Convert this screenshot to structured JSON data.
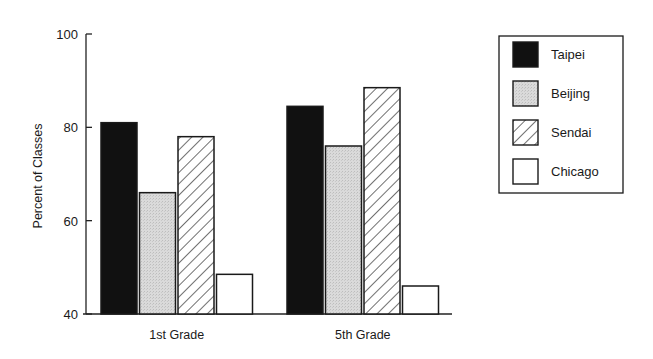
{
  "chart_data": {
    "type": "bar",
    "title": "",
    "xlabel": "",
    "ylabel": "Percent of Classes",
    "ylim": [
      40,
      100
    ],
    "yticks": [
      40,
      60,
      80,
      100
    ],
    "grid": false,
    "legend_position": "right",
    "categories": [
      "1st Grade",
      "5th Grade"
    ],
    "series": [
      {
        "name": "Taipei",
        "fill": "solid-black",
        "values": [
          81,
          84.5
        ]
      },
      {
        "name": "Beijing",
        "fill": "light-gray-stipple",
        "values": [
          66,
          76
        ]
      },
      {
        "name": "Sendai",
        "fill": "diagonal-hatch",
        "values": [
          78,
          88.5
        ]
      },
      {
        "name": "Chicago",
        "fill": "white",
        "values": [
          48.5,
          46
        ]
      }
    ]
  },
  "colors": {
    "taipei": "#111111",
    "beijing": "#d9d9d9",
    "sendai_hatch": "#333333",
    "chicago": "#ffffff",
    "axis": "#222222"
  }
}
